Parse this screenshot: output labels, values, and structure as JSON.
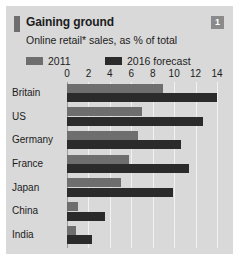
{
  "card": {
    "badge": "1",
    "title": "Gaining ground",
    "subtitle": "Online retail* sales, as % of total"
  },
  "legend": {
    "items": [
      {
        "label": "2011",
        "color": "#6e6e6e"
      },
      {
        "label": "2016 forecast",
        "color": "#2b2b2b"
      }
    ]
  },
  "colors": {
    "card_background": "#d9d9d9",
    "series_2011": "#6e6e6e",
    "series_2016": "#2b2b2b",
    "gridline": "#f2f2f2",
    "axis": "#9a9a9a",
    "badge": "#8a8a8a",
    "title_accent": "#6e6e6e"
  },
  "chart_data": {
    "type": "bar",
    "orientation": "horizontal",
    "title": "Gaining ground",
    "subtitle": "Online retail* sales, as % of total",
    "xlabel": "",
    "ylabel": "",
    "xlim": [
      0,
      14
    ],
    "xticks": [
      0,
      2,
      4,
      6,
      8,
      10,
      12,
      14
    ],
    "xtick_labels": [
      "0",
      "2",
      "4",
      "6",
      "8",
      "10",
      "12",
      "14"
    ],
    "grid": true,
    "legend_position": "top-left",
    "categories": [
      "Britain",
      "US",
      "Germany",
      "France",
      "Japan",
      "China",
      "India"
    ],
    "series": [
      {
        "name": "2011",
        "values": [
          9.0,
          7.0,
          6.6,
          5.8,
          5.0,
          1.0,
          0.8
        ]
      },
      {
        "name": "2016 forecast",
        "values": [
          14.0,
          12.7,
          10.6,
          11.4,
          9.9,
          3.5,
          2.3
        ]
      }
    ]
  }
}
